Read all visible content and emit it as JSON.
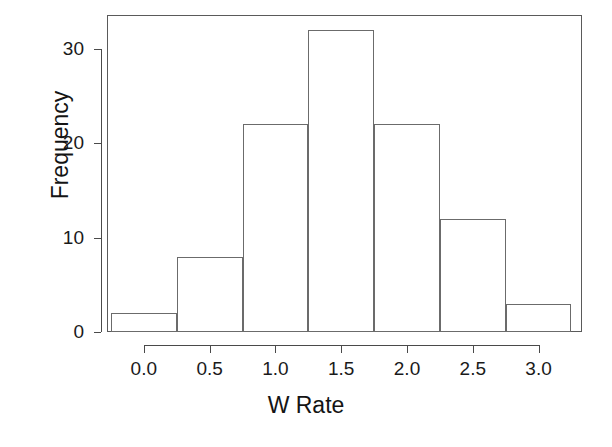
{
  "chart_data": {
    "type": "bar",
    "title": "",
    "subtitle": "",
    "xlabel": "W Rate",
    "ylabel": "Frequency",
    "categories": [
      "-0.25 – 0.25",
      "0.25 – 0.75",
      "0.75 – 1.25",
      "1.25 – 1.75",
      "1.75 – 2.25",
      "2.25 – 2.75",
      "2.75 – 3.25"
    ],
    "bin_edges": [
      -0.25,
      0.25,
      0.75,
      1.25,
      1.75,
      2.25,
      2.75,
      3.25
    ],
    "bin_width": 0.5,
    "values": [
      2,
      8,
      22,
      32,
      22,
      12,
      3
    ],
    "bars": [
      {
        "left": -0.25,
        "right": 0.25,
        "frequency": 2
      },
      {
        "left": 0.25,
        "right": 0.75,
        "frequency": 8
      },
      {
        "left": 0.75,
        "right": 1.25,
        "frequency": 22
      },
      {
        "left": 1.25,
        "right": 1.75,
        "frequency": 32
      },
      {
        "left": 1.75,
        "right": 2.25,
        "frequency": 22
      },
      {
        "left": 2.25,
        "right": 2.75,
        "frequency": 12
      },
      {
        "left": 2.75,
        "right": 3.25,
        "frequency": 3
      }
    ],
    "xlim": [
      -0.28,
      3.33
    ],
    "ylim": [
      0,
      33.6
    ],
    "xticks": [
      0.0,
      0.5,
      1.0,
      1.5,
      2.0,
      2.5,
      3.0
    ],
    "xtick_labels": [
      "0.0",
      "0.5",
      "1.0",
      "1.5",
      "2.0",
      "2.5",
      "3.0"
    ],
    "yticks": [
      0,
      10,
      20,
      30
    ],
    "ytick_labels": [
      "0",
      "10",
      "20",
      "30"
    ],
    "grid": false,
    "legend": false,
    "bar_fill_color": "#ffffff",
    "bar_border_color": "#6b6b6b",
    "axis_color": "#4a4a4a",
    "background_color": "#ffffff",
    "frame": true,
    "total_count": 101
  }
}
